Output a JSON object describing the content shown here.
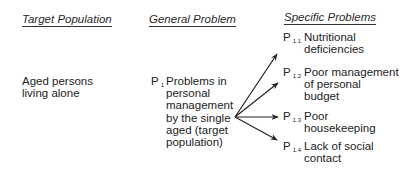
{
  "headers": {
    "target_population": "Target Population",
    "general_problem": "General Problem",
    "specific_problems": "Specific Problems"
  },
  "target_population": {
    "text_line1": "Aged persons",
    "text_line2": "living alone"
  },
  "general_problem": {
    "label": "P",
    "subscript": "1",
    "lines": [
      "Problems in",
      "personal",
      "management",
      "by the single",
      "aged (target",
      "population)"
    ]
  },
  "specific_problems": [
    {
      "label": "P",
      "subscript": "1.1",
      "lines": [
        "Nutritional",
        "deficiencies"
      ]
    },
    {
      "label": "P",
      "subscript": "1.2",
      "lines": [
        "Poor management",
        "of personal",
        "budget"
      ]
    },
    {
      "label": "P",
      "subscript": "1.3",
      "lines": [
        "Poor",
        "housekeeping"
      ]
    },
    {
      "label": "P",
      "subscript": "1.4",
      "lines": [
        "Lack of social",
        "contact"
      ]
    }
  ]
}
